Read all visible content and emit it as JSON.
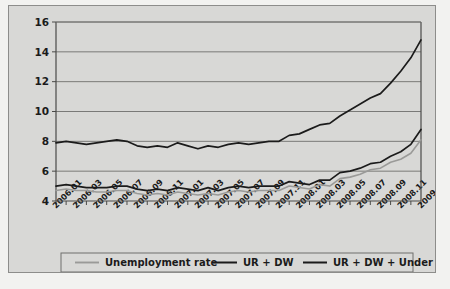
{
  "chart_data": {
    "type": "line",
    "title": "",
    "xlabel": "",
    "ylabel": "",
    "ylim": [
      4,
      16
    ],
    "yticks": [
      4,
      6,
      8,
      10,
      12,
      14,
      16
    ],
    "ytick_labels": [
      "4",
      "6",
      "8",
      "10",
      "12",
      "14",
      "16"
    ],
    "grid": true,
    "legend_position": "bottom",
    "x": [
      "2006.01",
      "2006.02",
      "2006.03",
      "2006.04",
      "2006.05",
      "2006.06",
      "2006.07",
      "2006.08",
      "2006.09",
      "2006.10",
      "2006.11",
      "2006.12",
      "2007.01",
      "2007.02",
      "2007.03",
      "2007.04",
      "2007.05",
      "2007.06",
      "2007.07",
      "2007.08",
      "2007.09",
      "2007.10",
      "2007.11",
      "2007.12",
      "2008.01",
      "2008.02",
      "2008.03",
      "2008.04",
      "2008.05",
      "2008.06",
      "2008.07",
      "2008.08",
      "2008.09",
      "2008.10",
      "2008.11",
      "2008.12",
      "2009.01"
    ],
    "xtick_labels": [
      "2006.01",
      "2006.03",
      "2006.05",
      "2006.07",
      "2006.09",
      "2006.11",
      "2007.01",
      "2007.03",
      "2007.05",
      "2007.07",
      "2007.09",
      "2007.11",
      "2008.01",
      "2008.03",
      "2008.05",
      "2008.07",
      "2008.09",
      "2008.11",
      "2009.01"
    ],
    "series": [
      {
        "name": "Unemployment rate",
        "color": "#9a9a98",
        "width": 1.6,
        "values": [
          4.7,
          4.8,
          4.7,
          4.7,
          4.6,
          4.6,
          4.7,
          4.7,
          4.5,
          4.4,
          4.5,
          4.4,
          4.6,
          4.5,
          4.4,
          4.5,
          4.4,
          4.6,
          4.7,
          4.6,
          4.7,
          4.7,
          4.7,
          5.0,
          4.9,
          4.8,
          5.1,
          5.0,
          5.5,
          5.6,
          5.8,
          6.1,
          6.2,
          6.6,
          6.8,
          7.2,
          8.1
        ]
      },
      {
        "name": "UR + DW",
        "color": "#1b1b1b",
        "width": 1.7,
        "values": [
          5.0,
          5.1,
          5.0,
          4.9,
          4.9,
          4.9,
          5.0,
          5.0,
          4.8,
          4.7,
          4.8,
          4.7,
          4.9,
          4.8,
          4.7,
          4.9,
          4.7,
          4.9,
          5.0,
          4.9,
          5.0,
          5.0,
          5.0,
          5.3,
          5.2,
          5.1,
          5.4,
          5.4,
          5.9,
          6.0,
          6.2,
          6.5,
          6.6,
          7.0,
          7.3,
          7.8,
          8.8
        ]
      },
      {
        "name": "UR + DW + Under",
        "color": "#1b1b1b",
        "width": 1.7,
        "values": [
          7.9,
          8.0,
          7.9,
          7.8,
          7.9,
          8.0,
          8.1,
          8.0,
          7.7,
          7.6,
          7.7,
          7.6,
          7.9,
          7.7,
          7.5,
          7.7,
          7.6,
          7.8,
          7.9,
          7.8,
          7.9,
          8.0,
          8.0,
          8.4,
          8.5,
          8.8,
          9.1,
          9.2,
          9.7,
          10.1,
          10.5,
          10.9,
          11.2,
          11.9,
          12.7,
          13.6,
          14.8
        ]
      }
    ]
  },
  "legend": {
    "items": [
      {
        "label": "Unemployment rate"
      },
      {
        "label": "UR + DW"
      },
      {
        "label": "UR + DW + Under"
      }
    ]
  }
}
